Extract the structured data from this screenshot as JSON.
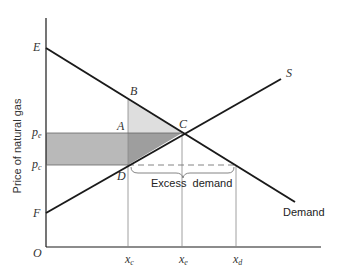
{
  "diagram": {
    "type": "supply-demand-price-ceiling",
    "y_axis_label": "Price of natural gas",
    "origin_label": "O",
    "point_labels": {
      "E": "E",
      "F": "F",
      "A": "A",
      "B": "B",
      "C": "C",
      "D": "D"
    },
    "price_labels": {
      "pe": "p",
      "pe_sub": "e",
      "pc": "p",
      "pc_sub": "c"
    },
    "quantity_labels": {
      "xc": "x",
      "xc_sub": "c",
      "xe": "x",
      "xe_sub": "e",
      "xd": "x",
      "xd_sub": "d"
    },
    "curve_labels": {
      "supply": "S",
      "demand": "Demand"
    },
    "annotation": "Excess  demand",
    "colors": {
      "line": "#1a1a1a",
      "guide": "#888888",
      "light_shade": "#dcdcdc",
      "mid_shade": "#b4b4b4",
      "dark_shade": "#9a9a9a"
    }
  }
}
